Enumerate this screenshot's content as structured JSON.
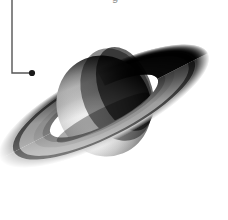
{
  "figure": {
    "background_color": "#ffffff",
    "width": 228,
    "height": 220,
    "clipped_caption_fragment": "g",
    "leader_line": {
      "name": "callout-leader-line",
      "color": "#555555",
      "stroke_width": 1.4,
      "vertical_x": 12,
      "vertical_top_y": 0,
      "corner_y": 73,
      "horizontal_end_x": 32
    },
    "marker_dot": {
      "name": "callout-marker-dot",
      "color": "#1a1a1a",
      "center_x": 32,
      "center_y": 73,
      "radius": 3.1
    },
    "planet": {
      "name": "saturn-globe",
      "center_x": 104,
      "center_y": 106,
      "radius_x": 47,
      "radius_y": 51,
      "rotation_deg": -22,
      "highlight_color": "#f2f2f2",
      "midtone_color": "#9a9a9a",
      "shadow_color": "#0a0a0a",
      "terminator_note": "bright limb on lower-left, deep shadow on right"
    },
    "rings": {
      "name": "saturn-ring-system",
      "tilt_deg": -27,
      "outer_radius_x": 117,
      "outer_radius_y": 36,
      "inner_radius_x": 60,
      "inner_radius_y": 18,
      "bands": [
        {
          "name": "a-ring",
          "color": "#c9c9c9",
          "from": 1.0,
          "to": 0.86
        },
        {
          "name": "cassini-division",
          "color": "#4a4a4a",
          "from": 0.86,
          "to": 0.8
        },
        {
          "name": "b-ring",
          "color": "#a8a8a8",
          "from": 0.8,
          "to": 0.62
        },
        {
          "name": "c-ring",
          "color": "#7d7d7d",
          "from": 0.62,
          "to": 0.5
        }
      ],
      "shadow_color": "#101010",
      "shadowed_side": "upper-right"
    }
  }
}
